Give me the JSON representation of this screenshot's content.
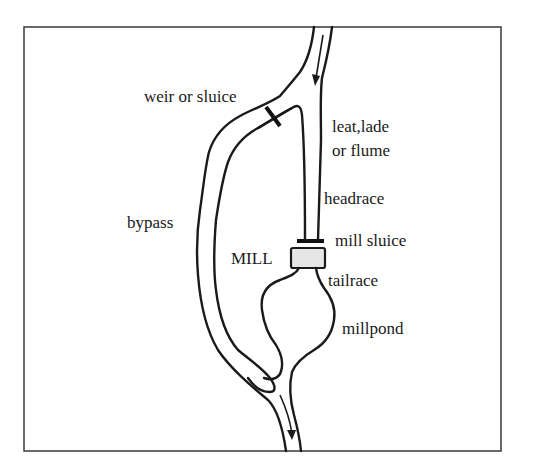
{
  "diagram": {
    "labels": {
      "weir": "weir or sluice",
      "leat_line1": "leat,lade",
      "leat_line2": "or flume",
      "headrace": "headrace",
      "bypass": "bypass",
      "mill_sluice": "mill sluice",
      "mill": "MILL",
      "tailrace": "tailrace",
      "millpond": "millpond"
    },
    "flow_direction": "top to bottom",
    "colors": {
      "line": "#1a1a1a",
      "mill_fill": "#e6e6e6",
      "background": "#ffffff"
    }
  }
}
